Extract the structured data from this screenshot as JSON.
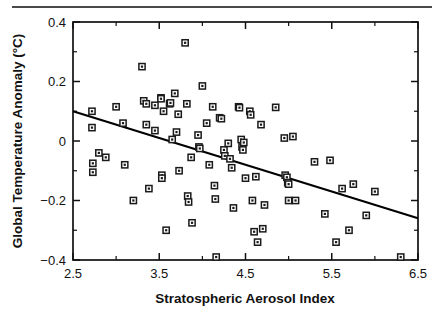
{
  "figure": {
    "has_top_rule": true,
    "background_color": "#ffffff",
    "foreground_color": "#111111"
  },
  "chart_data": {
    "type": "scatter",
    "title": "",
    "xlabel": "Stratospheric Aerosol Index",
    "ylabel": "Global Temperature Anomaly (°C)",
    "xlim": [
      2.5,
      6.5
    ],
    "ylim": [
      -0.4,
      0.4
    ],
    "xticks": [
      2.5,
      3.5,
      4.5,
      5.5,
      6.5
    ],
    "xtick_labels": [
      "2.5",
      "3.5",
      "4.5",
      "5.5",
      "6.5"
    ],
    "xticks_minor": [
      3.0,
      4.0,
      5.0,
      6.0
    ],
    "yticks": [
      -0.4,
      -0.2,
      0,
      0.2,
      0.4
    ],
    "ytick_labels": [
      "−0.4",
      "−0.2",
      "0",
      "0.2",
      "0.4"
    ],
    "yticks_minor": [
      -0.3,
      -0.1,
      0.1,
      0.3
    ],
    "grid": false,
    "legend": "none",
    "marker": "square-with-center-dot",
    "trend_line": {
      "x_start": 2.5,
      "y_start": 0.1,
      "x_end": 6.5,
      "y_end": -0.26,
      "slope": -0.09,
      "intercept": 0.325
    },
    "points": [
      [
        2.72,
        0.1
      ],
      [
        2.72,
        0.045
      ],
      [
        2.73,
        -0.075
      ],
      [
        2.73,
        -0.105
      ],
      [
        2.8,
        -0.04
      ],
      [
        2.88,
        -0.055
      ],
      [
        3.0,
        0.115
      ],
      [
        3.08,
        0.06
      ],
      [
        3.1,
        -0.08
      ],
      [
        3.2,
        -0.2
      ],
      [
        3.3,
        0.25
      ],
      [
        3.32,
        0.135
      ],
      [
        3.35,
        0.125
      ],
      [
        3.35,
        0.055
      ],
      [
        3.38,
        -0.16
      ],
      [
        3.45,
        0.12
      ],
      [
        3.45,
        0.035
      ],
      [
        3.52,
        0.145
      ],
      [
        3.52,
        0.142
      ],
      [
        3.53,
        -0.115
      ],
      [
        3.53,
        -0.125
      ],
      [
        3.55,
        0.1
      ],
      [
        3.58,
        -0.3
      ],
      [
        3.62,
        0.125
      ],
      [
        3.63,
        0.128
      ],
      [
        3.65,
        0.005
      ],
      [
        3.68,
        0.16
      ],
      [
        3.7,
        0.03
      ],
      [
        3.72,
        0.09
      ],
      [
        3.73,
        -0.1
      ],
      [
        3.8,
        0.33
      ],
      [
        3.82,
        0.125
      ],
      [
        3.83,
        -0.185
      ],
      [
        3.84,
        -0.205
      ],
      [
        3.87,
        -0.055
      ],
      [
        3.88,
        -0.275
      ],
      [
        3.95,
        0.02
      ],
      [
        3.96,
        -0.02
      ],
      [
        3.97,
        -0.025
      ],
      [
        4.0,
        0.185
      ],
      [
        4.05,
        0.06
      ],
      [
        4.08,
        -0.08
      ],
      [
        4.12,
        0.115
      ],
      [
        4.14,
        -0.15
      ],
      [
        4.15,
        -0.195
      ],
      [
        4.16,
        -0.39
      ],
      [
        4.2,
        0.078
      ],
      [
        4.22,
        0.075
      ],
      [
        4.25,
        -0.03
      ],
      [
        4.26,
        -0.05
      ],
      [
        4.3,
        -0.008
      ],
      [
        4.32,
        -0.06
      ],
      [
        4.34,
        -0.09
      ],
      [
        4.36,
        -0.225
      ],
      [
        4.42,
        0.115
      ],
      [
        4.43,
        0.112
      ],
      [
        4.45,
        0.005
      ],
      [
        4.46,
        -0.02
      ],
      [
        4.47,
        -0.03
      ],
      [
        4.48,
        -0.005
      ],
      [
        4.5,
        -0.125
      ],
      [
        4.55,
        0.1
      ],
      [
        4.56,
        0.088
      ],
      [
        4.58,
        -0.2
      ],
      [
        4.6,
        -0.305
      ],
      [
        4.62,
        -0.12
      ],
      [
        4.64,
        -0.34
      ],
      [
        4.68,
        0.055
      ],
      [
        4.7,
        -0.295
      ],
      [
        4.72,
        -0.215
      ],
      [
        4.85,
        0.113
      ],
      [
        4.95,
        0.01
      ],
      [
        4.96,
        -0.115
      ],
      [
        4.98,
        -0.122
      ],
      [
        4.99,
        -0.14
      ],
      [
        5.0,
        -0.145
      ],
      [
        5.0,
        -0.2
      ],
      [
        5.05,
        0.015
      ],
      [
        5.08,
        -0.2
      ],
      [
        5.3,
        -0.07
      ],
      [
        5.42,
        -0.245
      ],
      [
        5.48,
        -0.065
      ],
      [
        5.55,
        -0.34
      ],
      [
        5.62,
        -0.16
      ],
      [
        5.7,
        -0.3
      ],
      [
        5.75,
        -0.145
      ],
      [
        5.9,
        -0.25
      ],
      [
        6.0,
        -0.17
      ],
      [
        6.3,
        -0.39
      ]
    ]
  }
}
